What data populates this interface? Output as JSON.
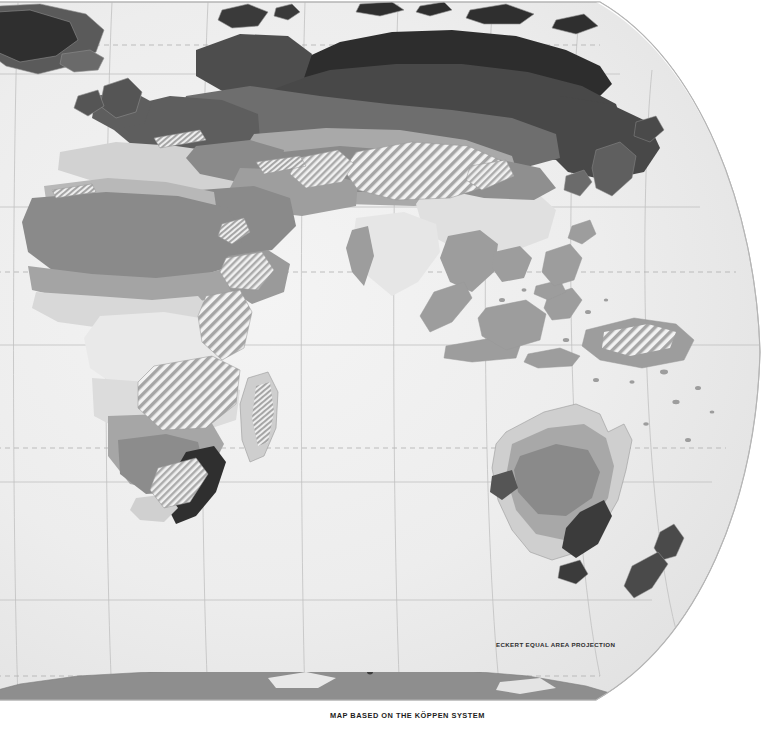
{
  "map": {
    "title_caption": "MAP BASED ON THE KÖPPEN SYSTEM",
    "projection_label": "ECKERT EQUAL AREA PROJECTION",
    "hemisphere_shown": "Eastern Hemisphere",
    "classification_system": "Köppen",
    "style": "grayscale thematic climate map",
    "colors": {
      "page_background": "#ffffff",
      "ocean": "#ededed",
      "ocean_edge_shade": "#e2e2e2",
      "graticule": "#b9b9b9",
      "dashed_graticule": "#b0b0b0",
      "map_border": "#b4b4b4",
      "coastline": "#9a9a9a",
      "ice_cap": "#2b2b2b",
      "subarctic_dark": "#484848",
      "continental_mid": "#6e6e6e",
      "desert_gray": "#8a8a8a",
      "steppe_light": "#a9a9a9",
      "tropical_mid": "#9d9d9d",
      "marine_light": "#c4c4c4",
      "mediterranean_pale": "#d8d8d8",
      "humid_pale": "#e4e4e4",
      "highland_hatch_stroke": "#9f9f9f",
      "antarctica": "#8e8e8e",
      "label_text": "#1d1d1d"
    },
    "legend_zones": [
      {
        "key": "ice-cap",
        "name": "Ice Cap",
        "fill": "#2b2b2b"
      },
      {
        "key": "subarctic",
        "name": "Subarctic",
        "fill": "#484848"
      },
      {
        "key": "humid-continental",
        "name": "Humid Continental",
        "fill": "#6e6e6e"
      },
      {
        "key": "desert",
        "name": "Desert",
        "fill": "#8a8a8a"
      },
      {
        "key": "steppe",
        "name": "Steppe",
        "fill": "#a9a9a9"
      },
      {
        "key": "tropical-rainforest",
        "name": "Tropical Rainforest",
        "fill": "#9d9d9d"
      },
      {
        "key": "marine-west-coast",
        "name": "Marine West Coast",
        "fill": "#c4c4c4"
      },
      {
        "key": "mediterranean",
        "name": "Mediterranean",
        "fill": "#d8d8d8"
      },
      {
        "key": "humid-subtropical",
        "name": "Humid Subtropical",
        "fill": "#e4e4e4"
      },
      {
        "key": "highland",
        "name": "Highland",
        "fill": "hatch"
      }
    ],
    "graticule": {
      "parallels_solid": 5,
      "parallels_dashed": 3,
      "meridians": 7,
      "dashed_lines": [
        "Arctic Circle",
        "Tropic of Cancer",
        "Tropic of Capricorn",
        "Antarctic Circle"
      ]
    },
    "landmasses": [
      "Greenland",
      "Iceland",
      "Svalbard",
      "Scandinavia",
      "British Isles",
      "Europe",
      "Africa",
      "Madagascar",
      "Arabian Peninsula",
      "Russia / Siberia",
      "Central Asia",
      "India",
      "Tibetan Plateau",
      "China",
      "Korea",
      "Japan",
      "Southeast Asia",
      "Indonesia",
      "Philippines",
      "New Guinea",
      "Australia",
      "New Zealand",
      "Antarctica"
    ]
  }
}
